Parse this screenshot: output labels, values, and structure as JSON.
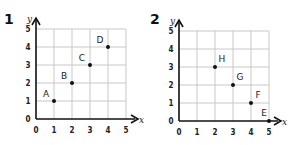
{
  "chart_data": [
    {
      "type": "scatter",
      "title": "1",
      "xlabel": "x",
      "ylabel": "y",
      "xlim": [
        0,
        5
      ],
      "ylim": [
        0,
        5
      ],
      "grid": true,
      "x_ticks": [
        "0",
        "1",
        "2",
        "3",
        "4",
        "5"
      ],
      "y_ticks": [
        "0",
        "1",
        "2",
        "3",
        "4",
        "5"
      ],
      "points": [
        {
          "label": "A",
          "x": 1,
          "y": 1
        },
        {
          "label": "B",
          "x": 2,
          "y": 2
        },
        {
          "label": "C",
          "x": 3,
          "y": 3
        },
        {
          "label": "D",
          "x": 4,
          "y": 4
        }
      ]
    },
    {
      "type": "scatter",
      "title": "2",
      "xlabel": "x",
      "ylabel": "y",
      "xlim": [
        0,
        5
      ],
      "ylim": [
        0,
        5
      ],
      "grid": true,
      "x_ticks": [
        "0",
        "1",
        "2",
        "3",
        "4",
        "5"
      ],
      "y_ticks": [
        "0",
        "1",
        "2",
        "3",
        "4",
        "5"
      ],
      "points": [
        {
          "label": "E",
          "x": 5,
          "y": 0
        },
        {
          "label": "F",
          "x": 4,
          "y": 1
        },
        {
          "label": "G",
          "x": 3,
          "y": 2
        },
        {
          "label": "H",
          "x": 2,
          "y": 3
        }
      ]
    }
  ]
}
